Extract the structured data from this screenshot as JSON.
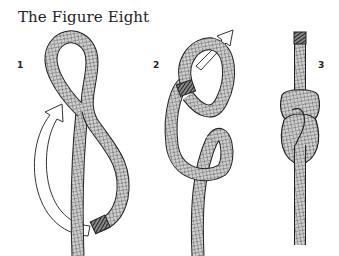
{
  "title": "The Figure Eight",
  "steps": [
    {
      "label": "1",
      "x": 17,
      "y": 60
    },
    {
      "label": "2",
      "x": 153,
      "y": 60
    },
    {
      "label": "3",
      "x": 318,
      "y": 60
    }
  ],
  "colors": {
    "rope_fill": "#c9c9c9",
    "rope_outline": "#222222",
    "rope_pattern": "#555555",
    "arrow_fill": "#ffffff",
    "arrow_stroke": "#333333",
    "background": "#ffffff"
  }
}
